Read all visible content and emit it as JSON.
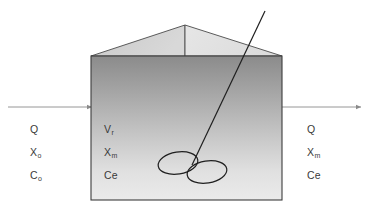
{
  "diagram": {
    "background_color": "#ffffff",
    "stroke_color": "#2b2b2b",
    "arrow_color": "#8a8a8a",
    "tank_fill_top": "#8d8d8d",
    "tank_fill_bottom": "#e9e9e9",
    "roof_fill_left": "#cfcfcf",
    "roof_fill_right": "#e4e4e4"
  },
  "influent": {
    "flow_label": "Q",
    "solids_label": "X",
    "solids_sub": "o",
    "substrate_label": "C",
    "substrate_sub": "o"
  },
  "reactor": {
    "volume_label": "V",
    "volume_sub": "r",
    "mixed_solids_label": "X",
    "mixed_solids_sub": "m",
    "effluent_conc_label": "Ce"
  },
  "effluent": {
    "flow_label": "Q",
    "solids_label": "X",
    "solids_sub": "m",
    "substrate_label": "Ce"
  },
  "icons": {
    "inlet_arrow": "arrow-right-icon",
    "outlet_arrow": "arrow-right-icon",
    "mixer": "impeller-icon",
    "shaft": "mixer-shaft-icon",
    "roof": "tank-roof-icon",
    "vessel": "tank-vessel-icon"
  }
}
